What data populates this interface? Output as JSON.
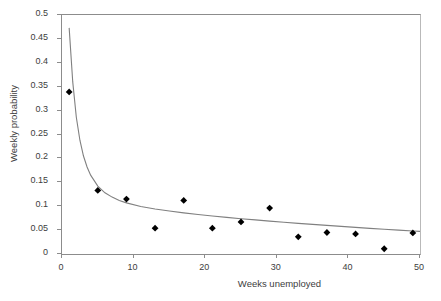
{
  "chart_data": {
    "type": "scatter",
    "title": "",
    "xlabel": "Weeks unemployed",
    "ylabel": "Weekly probability",
    "xlim": [
      0,
      50
    ],
    "ylim": [
      0,
      0.5
    ],
    "xticks": [
      "0",
      "10",
      "20",
      "30",
      "40",
      "50"
    ],
    "xtick_values": [
      0,
      10,
      20,
      30,
      40,
      50
    ],
    "yticks": [
      "0",
      "0.05",
      "0.1",
      "0.15",
      "0.2",
      "0.25",
      "0.3",
      "0.35",
      "0.4",
      "0.45",
      "0.5"
    ],
    "ytick_values": [
      0,
      0.05,
      0.1,
      0.15,
      0.2,
      0.25,
      0.3,
      0.35,
      0.4,
      0.45,
      0.5
    ],
    "grid": false,
    "legend": false,
    "series": [
      {
        "name": "Observed weekly probability",
        "type": "scatter",
        "marker": "diamond",
        "color": "#000000",
        "x": [
          1,
          5,
          9,
          13,
          17,
          21,
          25,
          29,
          33,
          37,
          41,
          45,
          49
        ],
        "y": [
          0.339,
          0.133,
          0.115,
          0.054,
          0.112,
          0.054,
          0.067,
          0.096,
          0.036,
          0.045,
          0.042,
          0.011,
          0.044
        ]
      },
      {
        "name": "Fitted curve",
        "type": "line",
        "color": "#808080",
        "x": [
          1,
          1.5,
          2,
          2.5,
          3,
          3.5,
          4,
          5,
          6,
          7,
          8,
          9,
          11,
          13,
          15,
          17,
          19,
          21,
          23,
          25,
          27,
          29,
          31,
          33,
          35,
          37,
          39,
          41,
          43,
          45,
          47,
          49,
          50
        ],
        "y": [
          0.473,
          0.36,
          0.286,
          0.238,
          0.205,
          0.182,
          0.165,
          0.142,
          0.128,
          0.119,
          0.112,
          0.107,
          0.0995,
          0.0942,
          0.0898,
          0.086,
          0.0826,
          0.0795,
          0.0766,
          0.0739,
          0.0713,
          0.0688,
          0.0664,
          0.0641,
          0.0619,
          0.0598,
          0.0577,
          0.0557,
          0.0537,
          0.0518,
          0.05,
          0.0482,
          0.0474
        ]
      }
    ]
  },
  "axes": {
    "y_title": "Weekly probability",
    "x_title": "Weeks unemployed"
  }
}
